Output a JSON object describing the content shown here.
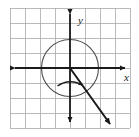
{
  "figure": {
    "name": "unit-circle-terminal-side-diagram",
    "background_color": "#ffffff"
  },
  "grid": {
    "name": "graph-paper-grid",
    "columns": 8,
    "rows": 8,
    "cell_size_px": 15,
    "left_px": 10,
    "top_px": 8,
    "width_px": 120,
    "height_px": 120,
    "line_color": "#a9a9a9",
    "line_width": 0.8,
    "show_border": true
  },
  "axes": {
    "name": "coordinate-axes",
    "color": "#1a1a1a",
    "line_width": 1.8,
    "origin_px": {
      "x": 70,
      "y": 68
    },
    "x_axis": {
      "name": "x-axis",
      "start_px": {
        "x": 11,
        "y": 68
      },
      "end_px": {
        "x": 129,
        "y": 68
      },
      "arrow_left": true,
      "arrow_right": true,
      "label": "x",
      "label_px": {
        "x": 127,
        "y": 80
      }
    },
    "y_axis": {
      "name": "y-axis",
      "start_px": {
        "x": 70,
        "y": 9
      },
      "end_px": {
        "x": 70,
        "y": 127
      },
      "arrow_up": true,
      "arrow_down": true,
      "label": "y",
      "label_px": {
        "x": 78,
        "y": 22
      }
    }
  },
  "circle": {
    "name": "circle-centered-at-origin",
    "center_px": {
      "x": 70,
      "y": 68
    },
    "radius_px": 28.5,
    "radius_units": 1.9,
    "stroke_color": "#4a4a4a",
    "stroke_width": 1.1,
    "fill": "none"
  },
  "terminal_ray": {
    "name": "terminal-side-ray",
    "from_px": {
      "x": 70,
      "y": 68
    },
    "to_px": {
      "x": 113,
      "y": 128
    },
    "quadrant": 4,
    "stroke_color": "#1a1a1a",
    "stroke_width": 2.0,
    "arrowhead": true,
    "arrowhead_tip_px": {
      "x": 113,
      "y": 128
    }
  },
  "angle_arc": {
    "name": "angle-sweep-arc",
    "center_px": {
      "x": 70,
      "y": 68
    },
    "radius_px": 22,
    "start_angle_deg": -90,
    "end_angle_deg": -54,
    "direction": "counterclockwise",
    "stroke_color": "#1a1a1a",
    "stroke_width": 1.4,
    "arrowhead": true
  },
  "colors": {
    "grid_line": "#a9a9a9",
    "axis": "#1a1a1a",
    "circle": "#4a4a4a",
    "ray": "#1a1a1a",
    "background": "#ffffff"
  }
}
